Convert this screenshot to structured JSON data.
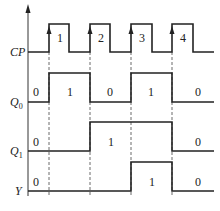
{
  "diagram": {
    "type": "timing-diagram",
    "signals": [
      {
        "name": "CP",
        "label": "CP",
        "pulses": [
          "1",
          "2",
          "3",
          "4"
        ]
      },
      {
        "name": "Q0",
        "label": "Q",
        "subscript": "0",
        "values": [
          "0",
          "1",
          "0",
          "1",
          "0"
        ]
      },
      {
        "name": "Q1",
        "label": "Q",
        "subscript": "1",
        "values": [
          "0",
          "1",
          "0"
        ]
      },
      {
        "name": "Y",
        "label": "Y",
        "values": [
          "0",
          "1",
          "0"
        ]
      }
    ],
    "colors": {
      "line": "#222222",
      "background": "#ffffff"
    }
  }
}
